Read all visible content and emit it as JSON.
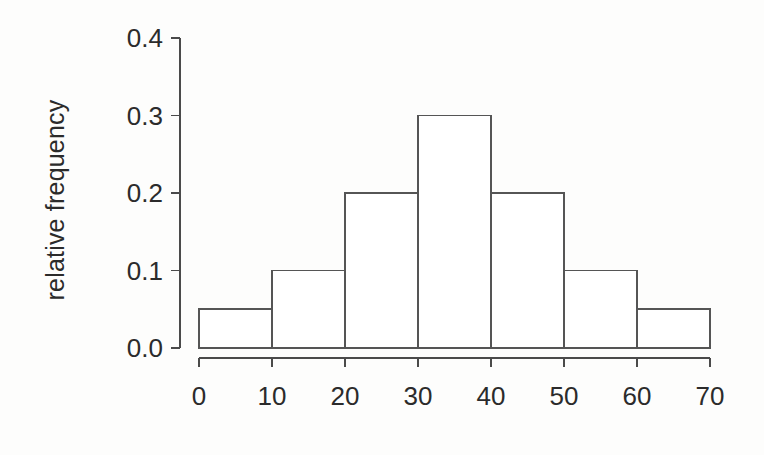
{
  "chart_data": {
    "type": "bar",
    "title": "",
    "subtitle": "",
    "xlabel": "",
    "ylabel": "relative frequency",
    "categories": [
      "0-10",
      "10-20",
      "20-30",
      "30-40",
      "40-50",
      "50-60",
      "60-70"
    ],
    "bin_edges": [
      0,
      10,
      20,
      30,
      40,
      50,
      60,
      70
    ],
    "values": [
      0.05,
      0.1,
      0.2,
      0.3,
      0.2,
      0.1,
      0.05
    ],
    "xlim": [
      0,
      70
    ],
    "ylim": [
      0.0,
      0.4
    ],
    "xticks": [
      0,
      10,
      20,
      30,
      40,
      50,
      60,
      70
    ],
    "xtick_labels": [
      "0",
      "10",
      "20",
      "30",
      "40",
      "50",
      "60",
      "70"
    ],
    "yticks": [
      0.0,
      0.1,
      0.2,
      0.3,
      0.4
    ],
    "ytick_labels": [
      "0.0",
      "0.1",
      "0.2",
      "0.3",
      "0.4"
    ],
    "grid": false,
    "legend": null,
    "bar_fill": "#ffffff",
    "bar_stroke": "#555555",
    "axis_color": "#4a4a4a",
    "background": "#fdfdfc",
    "annotations": []
  },
  "geometry": {
    "x_left_px": 199,
    "x_right_px": 710,
    "y_zero_px": 348,
    "y_top_px": 38,
    "y_axis_x_px": 180,
    "x_axis_y_px": 358,
    "tick_len_px": 9
  }
}
